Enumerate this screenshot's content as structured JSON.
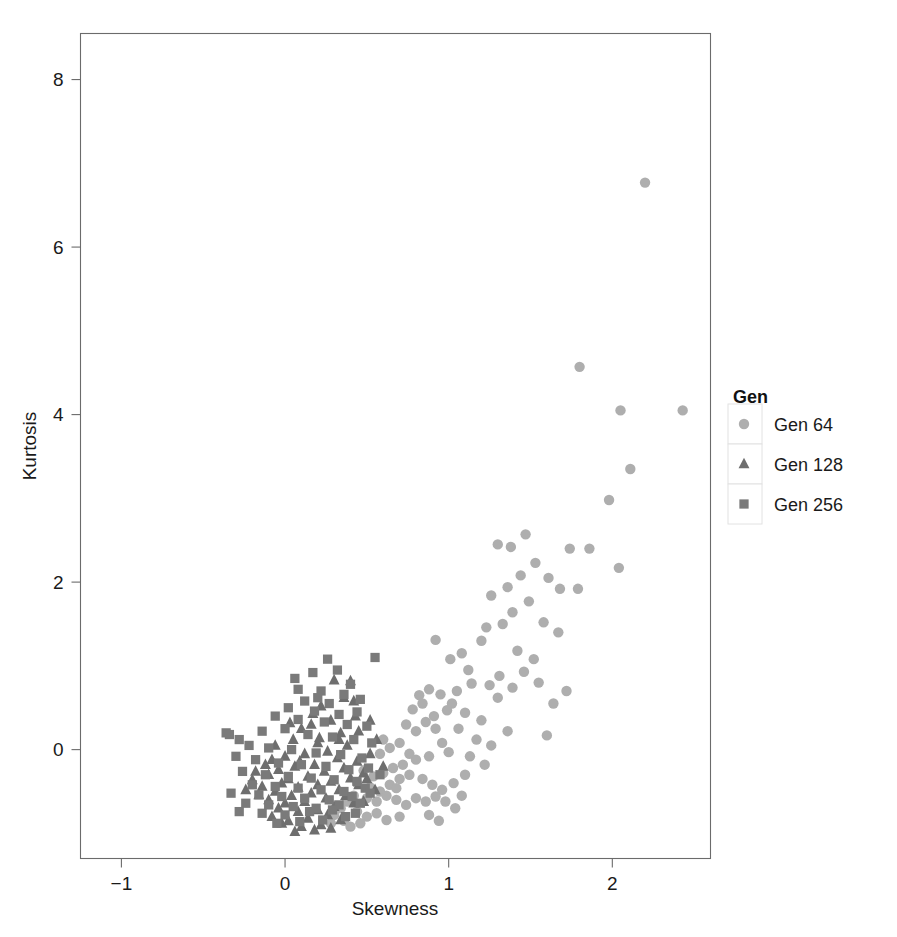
{
  "chart_data": {
    "type": "scatter",
    "title": "",
    "xlabel": "Skewness",
    "ylabel": "Kurtosis",
    "xlim": [
      -1.25,
      2.6
    ],
    "ylim": [
      -1.3,
      8.55
    ],
    "xticks": [
      -1,
      0,
      1,
      2
    ],
    "xticklabels": [
      "−1",
      "0",
      "1",
      "2"
    ],
    "yticks": [
      0,
      2,
      4,
      6,
      8
    ],
    "yticklabels": [
      "0",
      "2",
      "4",
      "6",
      "8"
    ],
    "grid": false,
    "legend": {
      "title": "Gen",
      "position": "right",
      "entries": [
        {
          "label": "Gen 64",
          "marker": "circle",
          "color": "#aeaeae"
        },
        {
          "label": "Gen 128",
          "marker": "triangle",
          "color": "#6e6e6e"
        },
        {
          "label": "Gen 256",
          "marker": "square",
          "color": "#7a7a7a"
        }
      ]
    },
    "series": [
      {
        "name": "Gen 64",
        "marker": "circle",
        "color": "#aeaeae",
        "points": [
          [
            2.2,
            6.77
          ],
          [
            1.8,
            4.57
          ],
          [
            2.05,
            4.05
          ],
          [
            2.43,
            4.05
          ],
          [
            2.11,
            3.35
          ],
          [
            1.98,
            2.98
          ],
          [
            1.86,
            2.4
          ],
          [
            1.47,
            2.57
          ],
          [
            1.3,
            2.45
          ],
          [
            1.38,
            2.42
          ],
          [
            1.74,
            2.4
          ],
          [
            2.04,
            2.17
          ],
          [
            1.53,
            2.23
          ],
          [
            1.61,
            2.05
          ],
          [
            1.44,
            2.08
          ],
          [
            1.68,
            1.92
          ],
          [
            1.79,
            1.92
          ],
          [
            1.36,
            1.94
          ],
          [
            1.26,
            1.84
          ],
          [
            1.49,
            1.77
          ],
          [
            1.39,
            1.64
          ],
          [
            1.58,
            1.52
          ],
          [
            1.67,
            1.4
          ],
          [
            1.33,
            1.5
          ],
          [
            1.23,
            1.46
          ],
          [
            1.2,
            1.3
          ],
          [
            0.92,
            1.31
          ],
          [
            1.72,
            0.7
          ],
          [
            1.46,
            0.93
          ],
          [
            1.31,
            0.88
          ],
          [
            1.55,
            0.8
          ],
          [
            1.39,
            0.74
          ],
          [
            1.25,
            0.77
          ],
          [
            1.14,
            0.79
          ],
          [
            1.05,
            0.7
          ],
          [
            1.6,
            0.17
          ],
          [
            1.2,
            0.35
          ],
          [
            1.1,
            0.44
          ],
          [
            1.02,
            0.55
          ],
          [
            0.95,
            0.66
          ],
          [
            0.88,
            0.72
          ],
          [
            0.82,
            0.65
          ],
          [
            0.99,
            0.47
          ],
          [
            0.91,
            0.4
          ],
          [
            0.86,
            0.33
          ],
          [
            1.06,
            0.25
          ],
          [
            1.17,
            0.12
          ],
          [
            1.26,
            0.05
          ],
          [
            0.8,
            0.22
          ],
          [
            0.74,
            0.3
          ],
          [
            0.7,
            0.08
          ],
          [
            0.64,
            0.02
          ],
          [
            0.58,
            -0.05
          ],
          [
            0.96,
            0.08
          ],
          [
            1.0,
            -0.03
          ],
          [
            0.88,
            -0.08
          ],
          [
            0.8,
            -0.12
          ],
          [
            0.72,
            -0.18
          ],
          [
            0.66,
            -0.22
          ],
          [
            0.6,
            -0.28
          ],
          [
            0.54,
            -0.32
          ],
          [
            0.48,
            -0.25
          ],
          [
            0.44,
            -0.4
          ],
          [
            0.52,
            -0.45
          ],
          [
            0.58,
            -0.5
          ],
          [
            0.64,
            -0.42
          ],
          [
            0.7,
            -0.35
          ],
          [
            0.76,
            -0.3
          ],
          [
            0.84,
            -0.35
          ],
          [
            0.9,
            -0.42
          ],
          [
            0.96,
            -0.48
          ],
          [
            1.03,
            -0.4
          ],
          [
            1.1,
            -0.3
          ],
          [
            0.5,
            -0.58
          ],
          [
            0.56,
            -0.62
          ],
          [
            0.62,
            -0.55
          ],
          [
            0.68,
            -0.6
          ],
          [
            0.74,
            -0.66
          ],
          [
            0.8,
            -0.58
          ],
          [
            0.86,
            -0.62
          ],
          [
            0.92,
            -0.56
          ],
          [
            0.42,
            -0.55
          ],
          [
            0.38,
            -0.62
          ],
          [
            0.34,
            -0.7
          ],
          [
            0.44,
            -0.74
          ],
          [
            0.5,
            -0.8
          ],
          [
            0.56,
            -0.76
          ],
          [
            0.62,
            -0.84
          ],
          [
            0.7,
            -0.8
          ],
          [
            0.46,
            -0.88
          ],
          [
            0.4,
            -0.92
          ],
          [
            0.36,
            -0.85
          ],
          [
            0.3,
            -0.78
          ],
          [
            0.28,
            -0.88
          ],
          [
            1.13,
            -0.08
          ],
          [
            1.22,
            -0.18
          ],
          [
            0.98,
            -0.62
          ],
          [
            1.04,
            -0.7
          ],
          [
            0.88,
            -0.78
          ],
          [
            0.94,
            -0.85
          ],
          [
            1.08,
            -0.55
          ],
          [
            1.3,
            0.62
          ],
          [
            1.12,
            0.95
          ],
          [
            1.42,
            1.18
          ],
          [
            1.52,
            1.08
          ],
          [
            1.64,
            0.55
          ],
          [
            1.36,
            0.22
          ],
          [
            0.78,
            0.48
          ],
          [
            0.84,
            0.55
          ],
          [
            0.92,
            0.25
          ],
          [
            1.08,
            1.15
          ],
          [
            1.01,
            1.08
          ],
          [
            0.76,
            -0.05
          ],
          [
            0.68,
            -0.46
          ],
          [
            0.6,
            0.12
          ]
        ]
      },
      {
        "name": "Gen 128",
        "marker": "triangle",
        "color": "#6e6e6e",
        "points": [
          [
            0.3,
            0.83
          ],
          [
            0.4,
            0.82
          ],
          [
            0.36,
            0.62
          ],
          [
            0.22,
            0.52
          ],
          [
            0.43,
            0.4
          ],
          [
            0.17,
            0.43
          ],
          [
            0.28,
            0.35
          ],
          [
            0.1,
            0.25
          ],
          [
            0.34,
            0.2
          ],
          [
            0.45,
            0.22
          ],
          [
            0.05,
            0.12
          ],
          [
            0.2,
            0.08
          ],
          [
            0.38,
            0.05
          ],
          [
            0.26,
            -0.02
          ],
          [
            0.12,
            -0.05
          ],
          [
            0.0,
            -0.08
          ],
          [
            -0.08,
            -0.12
          ],
          [
            0.32,
            -0.1
          ],
          [
            0.44,
            -0.14
          ],
          [
            0.52,
            -0.05
          ],
          [
            0.18,
            -0.18
          ],
          [
            0.06,
            -0.2
          ],
          [
            -0.04,
            -0.24
          ],
          [
            -0.12,
            -0.18
          ],
          [
            0.24,
            -0.26
          ],
          [
            0.36,
            -0.22
          ],
          [
            0.48,
            -0.28
          ],
          [
            0.14,
            -0.32
          ],
          [
            0.02,
            -0.35
          ],
          [
            -0.1,
            -0.3
          ],
          [
            -0.18,
            -0.26
          ],
          [
            0.28,
            -0.38
          ],
          [
            0.4,
            -0.34
          ],
          [
            0.2,
            -0.42
          ],
          [
            0.08,
            -0.45
          ],
          [
            -0.02,
            -0.4
          ],
          [
            -0.14,
            -0.44
          ],
          [
            0.33,
            -0.48
          ],
          [
            0.45,
            -0.42
          ],
          [
            0.16,
            -0.52
          ],
          [
            0.04,
            -0.55
          ],
          [
            -0.06,
            -0.5
          ],
          [
            -0.16,
            -0.54
          ],
          [
            0.25,
            -0.58
          ],
          [
            0.37,
            -0.55
          ],
          [
            0.12,
            -0.62
          ],
          [
            0.0,
            -0.64
          ],
          [
            -0.1,
            -0.6
          ],
          [
            0.3,
            -0.68
          ],
          [
            0.42,
            -0.64
          ],
          [
            0.2,
            -0.72
          ],
          [
            0.08,
            -0.74
          ],
          [
            -0.04,
            -0.7
          ],
          [
            0.26,
            -0.78
          ],
          [
            0.14,
            -0.82
          ],
          [
            0.02,
            -0.85
          ],
          [
            -0.08,
            -0.8
          ],
          [
            0.34,
            -0.84
          ],
          [
            0.22,
            -0.9
          ],
          [
            0.1,
            -0.92
          ],
          [
            -0.02,
            -0.88
          ],
          [
            0.18,
            -0.96
          ],
          [
            0.06,
            -0.98
          ],
          [
            0.28,
            -0.94
          ],
          [
            0.5,
            -0.35
          ],
          [
            0.55,
            -0.48
          ],
          [
            0.48,
            -0.62
          ],
          [
            -0.2,
            -0.36
          ],
          [
            -0.24,
            -0.48
          ],
          [
            0.16,
            0.3
          ],
          [
            0.03,
            0.32
          ],
          [
            0.42,
            0.58
          ],
          [
            0.52,
            0.35
          ],
          [
            0.56,
            0.12
          ],
          [
            0.09,
            -0.14
          ],
          [
            0.21,
            0.14
          ],
          [
            0.33,
            0.12
          ],
          [
            -0.06,
            0.05
          ],
          [
            0.6,
            -0.2
          ]
        ]
      },
      {
        "name": "Gen 256",
        "marker": "square",
        "color": "#7a7a7a",
        "points": [
          [
            0.55,
            1.1
          ],
          [
            0.26,
            1.08
          ],
          [
            0.17,
            0.92
          ],
          [
            0.32,
            0.95
          ],
          [
            0.4,
            0.78
          ],
          [
            0.08,
            0.72
          ],
          [
            0.22,
            0.7
          ],
          [
            0.36,
            0.66
          ],
          [
            0.46,
            0.6
          ],
          [
            0.12,
            0.58
          ],
          [
            0.27,
            0.55
          ],
          [
            0.02,
            0.5
          ],
          [
            0.18,
            0.46
          ],
          [
            0.33,
            0.42
          ],
          [
            0.44,
            0.45
          ],
          [
            -0.06,
            0.4
          ],
          [
            0.08,
            0.36
          ],
          [
            0.24,
            0.33
          ],
          [
            0.38,
            0.3
          ],
          [
            0.5,
            0.28
          ],
          [
            -0.34,
            0.18
          ],
          [
            -0.28,
            0.12
          ],
          [
            -0.14,
            0.22
          ],
          [
            0.0,
            0.25
          ],
          [
            0.14,
            0.18
          ],
          [
            0.29,
            0.15
          ],
          [
            0.42,
            0.12
          ],
          [
            0.53,
            0.08
          ],
          [
            -0.22,
            0.05
          ],
          [
            -0.1,
            0.02
          ],
          [
            0.04,
            0.0
          ],
          [
            0.19,
            -0.04
          ],
          [
            0.34,
            -0.06
          ],
          [
            0.47,
            -0.1
          ],
          [
            -0.3,
            -0.08
          ],
          [
            -0.18,
            -0.12
          ],
          [
            -0.04,
            -0.16
          ],
          [
            0.1,
            -0.18
          ],
          [
            0.25,
            -0.2
          ],
          [
            0.39,
            -0.24
          ],
          [
            0.51,
            -0.22
          ],
          [
            -0.26,
            -0.26
          ],
          [
            -0.12,
            -0.3
          ],
          [
            0.02,
            -0.32
          ],
          [
            0.16,
            -0.34
          ],
          [
            0.3,
            -0.36
          ],
          [
            0.44,
            -0.38
          ],
          [
            -0.2,
            -0.42
          ],
          [
            -0.06,
            -0.44
          ],
          [
            0.08,
            -0.46
          ],
          [
            0.22,
            -0.48
          ],
          [
            0.36,
            -0.5
          ],
          [
            0.49,
            -0.46
          ],
          [
            -0.33,
            -0.52
          ],
          [
            -0.16,
            -0.54
          ],
          [
            -0.02,
            -0.56
          ],
          [
            0.12,
            -0.58
          ],
          [
            0.27,
            -0.6
          ],
          [
            0.41,
            -0.56
          ],
          [
            -0.24,
            -0.64
          ],
          [
            -0.1,
            -0.66
          ],
          [
            0.05,
            -0.68
          ],
          [
            0.19,
            -0.7
          ],
          [
            0.33,
            -0.66
          ],
          [
            0.46,
            -0.64
          ],
          [
            -0.28,
            -0.74
          ],
          [
            -0.14,
            -0.76
          ],
          [
            0.0,
            -0.78
          ],
          [
            0.15,
            -0.74
          ],
          [
            0.29,
            -0.72
          ],
          [
            0.43,
            -0.76
          ],
          [
            0.09,
            -0.86
          ],
          [
            0.23,
            -0.84
          ],
          [
            0.37,
            -0.8
          ],
          [
            -0.05,
            -0.88
          ],
          [
            0.52,
            -0.52
          ],
          [
            0.58,
            -0.3
          ],
          [
            0.2,
            0.62
          ],
          [
            0.06,
            0.85
          ],
          [
            -0.36,
            0.2
          ]
        ]
      }
    ]
  },
  "axes": {
    "xlabel": "Skewness",
    "ylabel": "Kurtosis"
  },
  "legend": {
    "title": "Gen",
    "items": [
      {
        "label": "Gen 64"
      },
      {
        "label": "Gen 128"
      },
      {
        "label": "Gen 256"
      }
    ]
  }
}
